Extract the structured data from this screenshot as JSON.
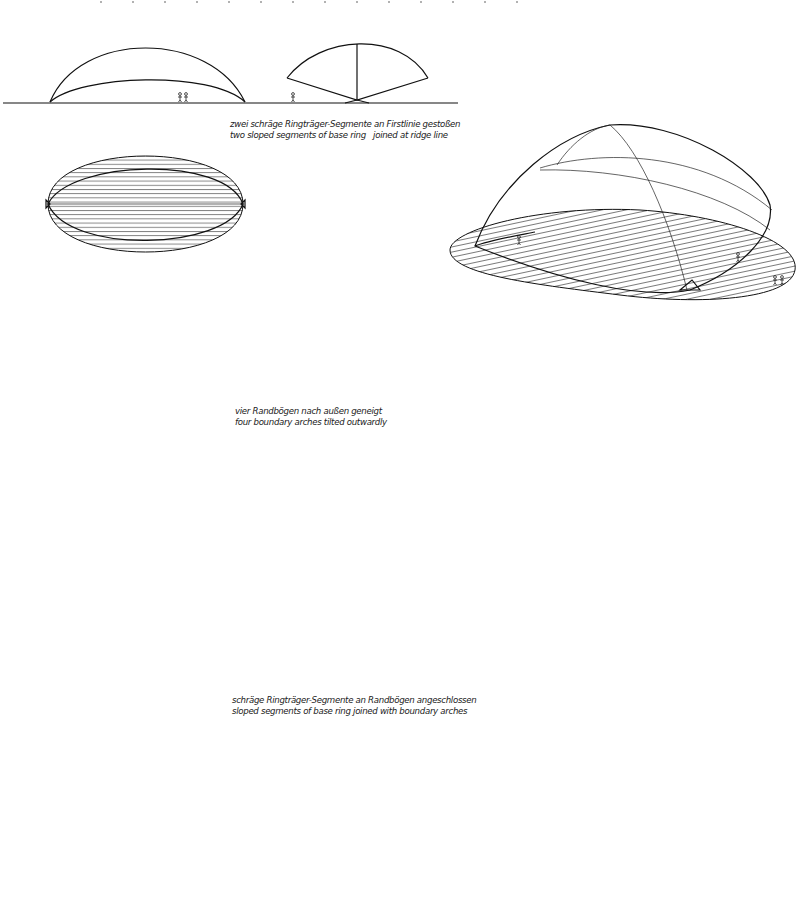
{
  "diagram": {
    "type": "architectural-study",
    "variants": [
      {
        "id": "variant-1",
        "caption_de": "zwei schräge Ringträger-Segmente an Firstlinie gestoßen",
        "caption_en": "two sloped segments of base ring   joined at ridge line",
        "views": [
          "section-long",
          "section-cross",
          "plan",
          "axonometric"
        ]
      },
      {
        "id": "variant-2",
        "caption_de": "vier Randbögen nach außen geneigt",
        "caption_en": "four boundary arches tilted outwardly",
        "views": [
          "section-long",
          "section-cross",
          "plan",
          "axonometric"
        ]
      },
      {
        "id": "variant-3",
        "caption_de": "schräge Ringträger-Segmente an Randbögen angeschlossen",
        "caption_en": "sloped segments of base ring joined with boundary arches",
        "views": [
          "section-long",
          "section-cross",
          "plan",
          "axonometric"
        ]
      }
    ],
    "colors": {
      "line": "#111111",
      "background": "#ffffff",
      "hatch": "#222222"
    }
  }
}
